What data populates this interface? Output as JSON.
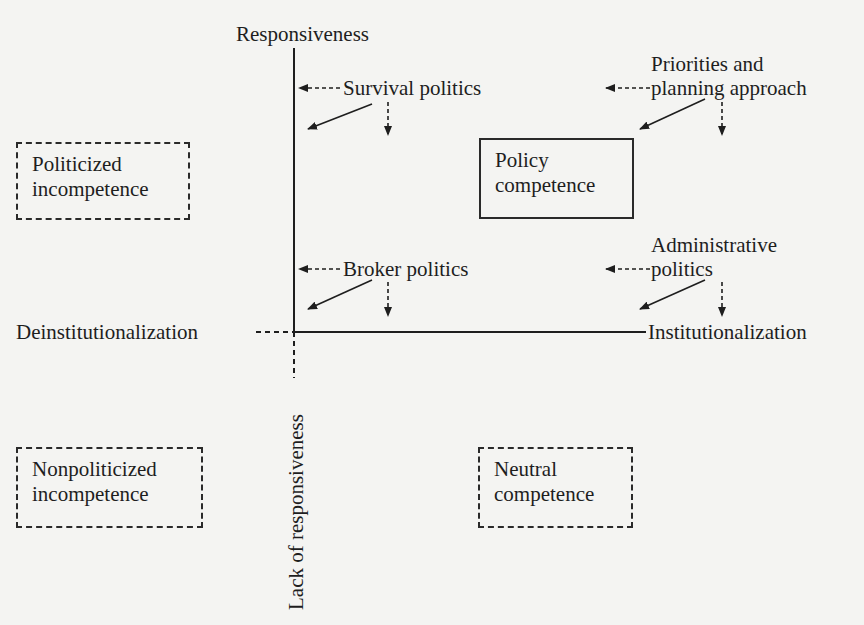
{
  "axes": {
    "top": "Responsiveness",
    "bottom": "Lack of responsiveness",
    "left": "Deinstitutionalization",
    "right": "Institutionalization"
  },
  "quadrant_boxes": [
    {
      "id": "politicized-incompetence",
      "line1": "Politicized",
      "line2": "incompetence",
      "border": "dashed"
    },
    {
      "id": "policy-competence",
      "line1": "Policy",
      "line2": "competence",
      "border": "solid"
    },
    {
      "id": "nonpoliticized-incompetence",
      "line1": "Nonpoliticized",
      "line2": "incompetence",
      "border": "dashed"
    },
    {
      "id": "neutral-competence",
      "line1": "Neutral",
      "line2": "competence",
      "border": "dashed"
    }
  ],
  "forces": [
    {
      "id": "survival-politics",
      "label": "Survival politics"
    },
    {
      "id": "priorities-planning",
      "line1": "Priorities and",
      "line2": "planning approach"
    },
    {
      "id": "broker-politics",
      "label": "Broker politics"
    },
    {
      "id": "administrative-politics",
      "line1": "Administrative",
      "line2": "politics"
    }
  ],
  "colors": {
    "ink": "#1e1e1e",
    "background": "#f4f4f2"
  }
}
